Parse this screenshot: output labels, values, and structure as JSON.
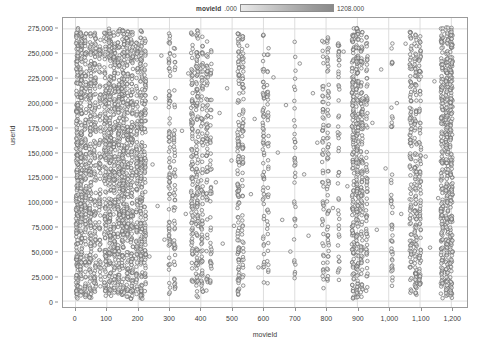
{
  "legend": {
    "title": "movieId",
    "min_label": ".000",
    "max_label": "1208.000",
    "gradient_from": "#e9e9e9",
    "gradient_to": "#8a8a8a"
  },
  "axes": {
    "x_title": "movieId",
    "y_title": "userId",
    "x_ticks": [
      "0",
      "100",
      "200",
      "300",
      "400",
      "500",
      "600",
      "700",
      "800",
      "900",
      "1,000",
      "1,100",
      "1,200"
    ],
    "y_ticks": [
      "0",
      "25,000",
      "50,000",
      "75,000",
      "100,000",
      "125,000",
      "150,000",
      "175,000",
      "200,000",
      "225,000",
      "250,000",
      "275,000"
    ]
  },
  "chart_data": {
    "type": "scatter",
    "title": "",
    "xlabel": "movieId",
    "ylabel": "userId",
    "xlim": [
      -40,
      1250
    ],
    "ylim": [
      -6000,
      286000
    ],
    "grid": true,
    "legend_position": "top",
    "marker": {
      "shape": "circle",
      "filled": false,
      "size_px": 3.6,
      "stroke": "#6e6e6e",
      "fill": "#f2f2f2"
    },
    "colorbar": {
      "variable": "movieId",
      "min": 0.0,
      "max": 1208.0
    },
    "bands": [
      {
        "x": 5,
        "density": 0.92,
        "width": 7,
        "ymin": 2000,
        "ymax": 277000
      },
      {
        "x": 18,
        "density": 0.8,
        "width": 6,
        "ymin": 3000,
        "ymax": 276000
      },
      {
        "x": 32,
        "density": 0.58,
        "width": 6,
        "ymin": 4000,
        "ymax": 274000
      },
      {
        "x": 47,
        "density": 0.7,
        "width": 7,
        "ymin": 2000,
        "ymax": 276000
      },
      {
        "x": 62,
        "density": 0.55,
        "width": 6,
        "ymin": 5000,
        "ymax": 272000
      },
      {
        "x": 78,
        "density": 0.4,
        "width": 6,
        "ymin": 6000,
        "ymax": 270000
      },
      {
        "x": 95,
        "density": 0.62,
        "width": 7,
        "ymin": 2000,
        "ymax": 275000
      },
      {
        "x": 110,
        "density": 0.85,
        "width": 8,
        "ymin": 1500,
        "ymax": 277000
      },
      {
        "x": 124,
        "density": 0.66,
        "width": 6,
        "ymin": 3000,
        "ymax": 274000
      },
      {
        "x": 138,
        "density": 0.74,
        "width": 7,
        "ymin": 2500,
        "ymax": 276000
      },
      {
        "x": 152,
        "density": 0.88,
        "width": 8,
        "ymin": 1500,
        "ymax": 277000
      },
      {
        "x": 166,
        "density": 0.6,
        "width": 6,
        "ymin": 4000,
        "ymax": 273000
      },
      {
        "x": 180,
        "density": 0.72,
        "width": 7,
        "ymin": 2000,
        "ymax": 275000
      },
      {
        "x": 196,
        "density": 0.5,
        "width": 6,
        "ymin": 5000,
        "ymax": 271000
      },
      {
        "x": 210,
        "density": 0.78,
        "width": 7,
        "ymin": 2000,
        "ymax": 276000
      },
      {
        "x": 222,
        "density": 0.44,
        "width": 5,
        "ymin": 6000,
        "ymax": 268000
      },
      {
        "x": 300,
        "density": 0.38,
        "width": 5,
        "ymin": 5000,
        "ymax": 272000
      },
      {
        "x": 316,
        "density": 0.26,
        "width": 5,
        "ymin": 12000,
        "ymax": 266000
      },
      {
        "x": 372,
        "density": 0.46,
        "width": 6,
        "ymin": 6000,
        "ymax": 273000
      },
      {
        "x": 388,
        "density": 0.58,
        "width": 7,
        "ymin": 3000,
        "ymax": 275000
      },
      {
        "x": 404,
        "density": 0.4,
        "width": 6,
        "ymin": 8000,
        "ymax": 270000
      },
      {
        "x": 420,
        "density": 0.3,
        "width": 5,
        "ymin": 10000,
        "ymax": 264000
      },
      {
        "x": 432,
        "density": 0.22,
        "width": 5,
        "ymin": 14000,
        "ymax": 258000
      },
      {
        "x": 520,
        "density": 0.54,
        "width": 6,
        "ymin": 3000,
        "ymax": 274000
      },
      {
        "x": 534,
        "density": 0.34,
        "width": 5,
        "ymin": 9000,
        "ymax": 268000
      },
      {
        "x": 600,
        "density": 0.3,
        "width": 5,
        "ymin": 8000,
        "ymax": 270000
      },
      {
        "x": 614,
        "density": 0.2,
        "width": 5,
        "ymin": 16000,
        "ymax": 260000
      },
      {
        "x": 700,
        "density": 0.18,
        "width": 5,
        "ymin": 18000,
        "ymax": 262000
      },
      {
        "x": 790,
        "density": 0.26,
        "width": 5,
        "ymin": 10000,
        "ymax": 268000
      },
      {
        "x": 806,
        "density": 0.32,
        "width": 6,
        "ymin": 7000,
        "ymax": 271000
      },
      {
        "x": 840,
        "density": 0.24,
        "width": 5,
        "ymin": 12000,
        "ymax": 264000
      },
      {
        "x": 886,
        "density": 0.68,
        "width": 7,
        "ymin": 2500,
        "ymax": 276000
      },
      {
        "x": 900,
        "density": 0.82,
        "width": 8,
        "ymin": 1500,
        "ymax": 277000
      },
      {
        "x": 914,
        "density": 0.56,
        "width": 6,
        "ymin": 4000,
        "ymax": 273000
      },
      {
        "x": 930,
        "density": 0.34,
        "width": 5,
        "ymin": 9000,
        "ymax": 267000
      },
      {
        "x": 1010,
        "density": 0.22,
        "width": 5,
        "ymin": 14000,
        "ymax": 262000
      },
      {
        "x": 1070,
        "density": 0.48,
        "width": 6,
        "ymin": 5000,
        "ymax": 273000
      },
      {
        "x": 1086,
        "density": 0.6,
        "width": 7,
        "ymin": 3000,
        "ymax": 275000
      },
      {
        "x": 1100,
        "density": 0.42,
        "width": 6,
        "ymin": 7000,
        "ymax": 270000
      },
      {
        "x": 1170,
        "density": 0.76,
        "width": 7,
        "ymin": 2000,
        "ymax": 276000
      },
      {
        "x": 1186,
        "density": 0.9,
        "width": 8,
        "ymin": 1500,
        "ymax": 277000
      },
      {
        "x": 1200,
        "density": 0.86,
        "width": 8,
        "ymin": 1500,
        "ymax": 277000
      }
    ],
    "sparse_points": [
      {
        "x": 236,
        "y": 45000
      },
      {
        "x": 246,
        "y": 138000
      },
      {
        "x": 255,
        "y": 205000
      },
      {
        "x": 262,
        "y": 96000
      },
      {
        "x": 274,
        "y": 248000
      },
      {
        "x": 284,
        "y": 62000
      },
      {
        "x": 340,
        "y": 172000
      },
      {
        "x": 352,
        "y": 88000
      },
      {
        "x": 360,
        "y": 230000
      },
      {
        "x": 448,
        "y": 120000
      },
      {
        "x": 460,
        "y": 190000
      },
      {
        "x": 470,
        "y": 58000
      },
      {
        "x": 484,
        "y": 215000
      },
      {
        "x": 498,
        "y": 142000
      },
      {
        "x": 506,
        "y": 76000
      },
      {
        "x": 548,
        "y": 258000
      },
      {
        "x": 560,
        "y": 108000
      },
      {
        "x": 572,
        "y": 184000
      },
      {
        "x": 584,
        "y": 34000
      },
      {
        "x": 632,
        "y": 226000
      },
      {
        "x": 646,
        "y": 150000
      },
      {
        "x": 660,
        "y": 82000
      },
      {
        "x": 672,
        "y": 198000
      },
      {
        "x": 686,
        "y": 50000
      },
      {
        "x": 716,
        "y": 240000
      },
      {
        "x": 730,
        "y": 128000
      },
      {
        "x": 744,
        "y": 66000
      },
      {
        "x": 758,
        "y": 210000
      },
      {
        "x": 772,
        "y": 160000
      },
      {
        "x": 822,
        "y": 94000
      },
      {
        "x": 856,
        "y": 252000
      },
      {
        "x": 868,
        "y": 116000
      },
      {
        "x": 948,
        "y": 180000
      },
      {
        "x": 962,
        "y": 72000
      },
      {
        "x": 976,
        "y": 234000
      },
      {
        "x": 990,
        "y": 134000
      },
      {
        "x": 1026,
        "y": 200000
      },
      {
        "x": 1040,
        "y": 88000
      },
      {
        "x": 1054,
        "y": 260000
      },
      {
        "x": 1118,
        "y": 146000
      },
      {
        "x": 1132,
        "y": 54000
      },
      {
        "x": 1146,
        "y": 222000
      },
      {
        "x": 1158,
        "y": 104000
      }
    ]
  }
}
